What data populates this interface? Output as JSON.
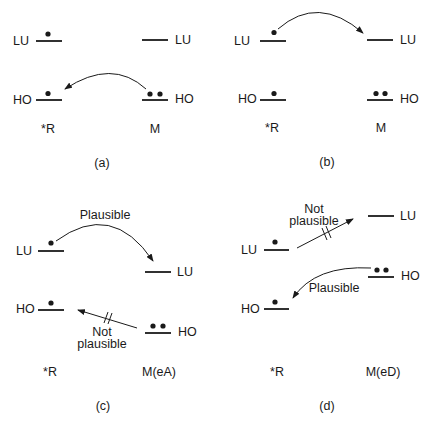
{
  "colors": {
    "ink": "#1a1a1a",
    "background": "#ffffff"
  },
  "panels": [
    {
      "id": "a",
      "caption": "(a)",
      "left_species": "*R",
      "right_species": "M",
      "left_levels": {
        "lu": "LU",
        "ho": "HO",
        "lu_electrons": 1,
        "ho_electrons": 1
      },
      "right_levels": {
        "lu": "LU",
        "ho": "HO",
        "lu_electrons": 0,
        "ho_electrons": 2
      },
      "arrows": [
        {
          "from": "M HO",
          "to": "*R HO",
          "label": ""
        }
      ]
    },
    {
      "id": "b",
      "caption": "(b)",
      "left_species": "*R",
      "right_species": "M",
      "left_levels": {
        "lu": "LU",
        "ho": "HO",
        "lu_electrons": 1,
        "ho_electrons": 1
      },
      "right_levels": {
        "lu": "LU",
        "ho": "HO",
        "lu_electrons": 0,
        "ho_electrons": 2
      },
      "arrows": [
        {
          "from": "*R LU",
          "to": "M LU",
          "label": ""
        }
      ]
    },
    {
      "id": "c",
      "caption": "(c)",
      "left_species": "*R",
      "right_species": "M(eA)",
      "left_levels": {
        "lu": "LU",
        "ho": "HO",
        "lu_electrons": 1,
        "ho_electrons": 1
      },
      "right_levels": {
        "lu": "LU",
        "ho": "HO",
        "lu_electrons": 0,
        "ho_electrons": 2
      },
      "arrows": [
        {
          "from": "*R LU",
          "to": "M LU",
          "label": "Plausible"
        },
        {
          "from": "M HO",
          "to": "*R HO",
          "label_line1": "Not",
          "label_line2": "plausible",
          "blocked": true
        }
      ]
    },
    {
      "id": "d",
      "caption": "(d)",
      "left_species": "*R",
      "right_species": "M(eD)",
      "left_levels": {
        "lu": "LU",
        "ho": "HO",
        "lu_electrons": 1,
        "ho_electrons": 1
      },
      "right_levels": {
        "lu": "LU",
        "ho": "HO",
        "lu_electrons": 0,
        "ho_electrons": 2
      },
      "arrows": [
        {
          "from": "*R LU",
          "to": "M LU",
          "label_line1": "Not",
          "label_line2": "plausible",
          "blocked": true
        },
        {
          "from": "M HO",
          "to": "*R HO",
          "label": "Plausible"
        }
      ]
    }
  ]
}
